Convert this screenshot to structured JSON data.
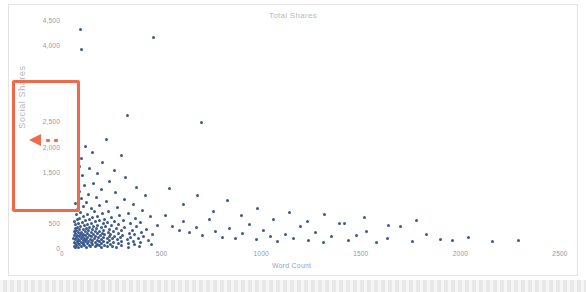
{
  "chart_data": {
    "type": "scatter",
    "title": "Total Shares",
    "xlabel": "Word Count",
    "ylabel": "Social Shares",
    "xlim": [
      0,
      2500
    ],
    "ylim": [
      0,
      4500
    ],
    "grid": false,
    "legend": null,
    "marker_color": "#3a5a8c",
    "xticks": [
      "0",
      "500",
      "1000",
      "1500",
      "2000",
      "2500"
    ],
    "xtick_values": [
      0,
      500,
      1000,
      1500,
      2000,
      2500
    ],
    "yticks": [
      "0",
      "500",
      "1,500",
      "2,000",
      "2,500",
      "4,000",
      "4,500"
    ],
    "ytick_values": [
      0,
      500,
      1500,
      2000,
      2500,
      4000,
      4500
    ],
    "points": [
      [
        92,
        4320
      ],
      [
        96,
        3910
      ],
      [
        460,
        4150
      ],
      [
        330,
        2620
      ],
      [
        700,
        2470
      ],
      [
        225,
        2150
      ],
      [
        118,
        2010
      ],
      [
        152,
        1880
      ],
      [
        300,
        1820
      ],
      [
        98,
        1760
      ],
      [
        205,
        1690
      ],
      [
        88,
        1600
      ],
      [
        140,
        1560
      ],
      [
        262,
        1520
      ],
      [
        178,
        1470
      ],
      [
        104,
        1430
      ],
      [
        318,
        1390
      ],
      [
        82,
        1350
      ],
      [
        238,
        1310
      ],
      [
        158,
        1270
      ],
      [
        112,
        1230
      ],
      [
        372,
        1190
      ],
      [
        196,
        1160
      ],
      [
        86,
        1120
      ],
      [
        268,
        1090
      ],
      [
        132,
        1060
      ],
      [
        420,
        1030
      ],
      [
        172,
        1000
      ],
      [
        96,
        975
      ],
      [
        312,
        950
      ],
      [
        222,
        925
      ],
      [
        124,
        900
      ],
      [
        66,
        880
      ],
      [
        358,
        860
      ],
      [
        186,
        840
      ],
      [
        108,
        820
      ],
      [
        280,
        800
      ],
      [
        148,
        780
      ],
      [
        78,
        760
      ],
      [
        402,
        745
      ],
      [
        232,
        730
      ],
      [
        162,
        715
      ],
      [
        94,
        700
      ],
      [
        334,
        688
      ],
      [
        202,
        676
      ],
      [
        126,
        664
      ],
      [
        72,
        652
      ],
      [
        290,
        640
      ],
      [
        176,
        630
      ],
      [
        110,
        620
      ],
      [
        446,
        612
      ],
      [
        246,
        604
      ],
      [
        154,
        596
      ],
      [
        88,
        588
      ],
      [
        368,
        580
      ],
      [
        214,
        572
      ],
      [
        138,
        565
      ],
      [
        80,
        558
      ],
      [
        308,
        550
      ],
      [
        190,
        543
      ],
      [
        118,
        536
      ],
      [
        62,
        530
      ],
      [
        262,
        523
      ],
      [
        168,
        516
      ],
      [
        102,
        510
      ],
      [
        392,
        504
      ],
      [
        228,
        498
      ],
      [
        146,
        492
      ],
      [
        84,
        486
      ],
      [
        344,
        480
      ],
      [
        206,
        474
      ],
      [
        128,
        468
      ],
      [
        70,
        462
      ],
      [
        284,
        456
      ],
      [
        180,
        450
      ],
      [
        112,
        445
      ],
      [
        478,
        440
      ],
      [
        250,
        435
      ],
      [
        160,
        430
      ],
      [
        94,
        425
      ],
      [
        372,
        420
      ],
      [
        218,
        415
      ],
      [
        140,
        410
      ],
      [
        76,
        405
      ],
      [
        316,
        400
      ],
      [
        196,
        395
      ],
      [
        122,
        390
      ],
      [
        66,
        386
      ],
      [
        272,
        382
      ],
      [
        174,
        378
      ],
      [
        106,
        374
      ],
      [
        424,
        370
      ],
      [
        240,
        366
      ],
      [
        154,
        362
      ],
      [
        88,
        358
      ],
      [
        356,
        354
      ],
      [
        210,
        350
      ],
      [
        134,
        346
      ],
      [
        74,
        342
      ],
      [
        298,
        338
      ],
      [
        186,
        334
      ],
      [
        116,
        330
      ],
      [
        62,
        326
      ],
      [
        258,
        322
      ],
      [
        166,
        318
      ],
      [
        100,
        314
      ],
      [
        398,
        310
      ],
      [
        232,
        306
      ],
      [
        148,
        302
      ],
      [
        84,
        298
      ],
      [
        338,
        294
      ],
      [
        202,
        290
      ],
      [
        128,
        287
      ],
      [
        70,
        284
      ],
      [
        286,
        281
      ],
      [
        178,
        278
      ],
      [
        110,
        275
      ],
      [
        452,
        272
      ],
      [
        244,
        269
      ],
      [
        158,
        266
      ],
      [
        92,
        263
      ],
      [
        364,
        260
      ],
      [
        214,
        257
      ],
      [
        138,
        254
      ],
      [
        78,
        251
      ],
      [
        306,
        248
      ],
      [
        192,
        245
      ],
      [
        120,
        242
      ],
      [
        64,
        239
      ],
      [
        266,
        236
      ],
      [
        170,
        233
      ],
      [
        102,
        230
      ],
      [
        408,
        227
      ],
      [
        236,
        224
      ],
      [
        150,
        221
      ],
      [
        86,
        218
      ],
      [
        346,
        215
      ],
      [
        206,
        212
      ],
      [
        130,
        209
      ],
      [
        72,
        206
      ],
      [
        292,
        203
      ],
      [
        182,
        200
      ],
      [
        112,
        197
      ],
      [
        60,
        194
      ],
      [
        254,
        191
      ],
      [
        164,
        188
      ],
      [
        98,
        185
      ],
      [
        384,
        182
      ],
      [
        226,
        179
      ],
      [
        144,
        176
      ],
      [
        82,
        173
      ],
      [
        330,
        170
      ],
      [
        198,
        167
      ],
      [
        124,
        164
      ],
      [
        68,
        161
      ],
      [
        278,
        158
      ],
      [
        176,
        155
      ],
      [
        108,
        152
      ],
      [
        436,
        150
      ],
      [
        240,
        147
      ],
      [
        152,
        144
      ],
      [
        90,
        141
      ],
      [
        358,
        138
      ],
      [
        210,
        135
      ],
      [
        134,
        132
      ],
      [
        76,
        129
      ],
      [
        300,
        126
      ],
      [
        188,
        123
      ],
      [
        116,
        120
      ],
      [
        62,
        117
      ],
      [
        260,
        114
      ],
      [
        168,
        111
      ],
      [
        100,
        108
      ],
      [
        392,
        105
      ],
      [
        230,
        102
      ],
      [
        146,
        99
      ],
      [
        84,
        96
      ],
      [
        336,
        93
      ],
      [
        200,
        90
      ],
      [
        126,
        87
      ],
      [
        70,
        84
      ],
      [
        284,
        81
      ],
      [
        178,
        78
      ],
      [
        110,
        75
      ],
      [
        448,
        72
      ],
      [
        242,
        69
      ],
      [
        154,
        66
      ],
      [
        90,
        63
      ],
      [
        362,
        60
      ],
      [
        212,
        57
      ],
      [
        136,
        54
      ],
      [
        74,
        51
      ],
      [
        298,
        48
      ],
      [
        186,
        45
      ],
      [
        114,
        42
      ],
      [
        64,
        39
      ],
      [
        256,
        36
      ],
      [
        166,
        33
      ],
      [
        98,
        30
      ],
      [
        388,
        28
      ],
      [
        228,
        25
      ],
      [
        144,
        22
      ],
      [
        82,
        19
      ],
      [
        332,
        16
      ],
      [
        196,
        13
      ],
      [
        122,
        10
      ],
      [
        66,
        8
      ],
      [
        274,
        6
      ],
      [
        172,
        50
      ],
      [
        106,
        95
      ],
      [
        520,
        640
      ],
      [
        556,
        430
      ],
      [
        588,
        350
      ],
      [
        612,
        520
      ],
      [
        640,
        300
      ],
      [
        676,
        410
      ],
      [
        704,
        250
      ],
      [
        742,
        560
      ],
      [
        770,
        330
      ],
      [
        806,
        210
      ],
      [
        840,
        380
      ],
      [
        872,
        180
      ],
      [
        906,
        290
      ],
      [
        940,
        460
      ],
      [
        978,
        160
      ],
      [
        1012,
        340
      ],
      [
        1048,
        230
      ],
      [
        1084,
        130
      ],
      [
        1122,
        260
      ],
      [
        1160,
        190
      ],
      [
        1198,
        420
      ],
      [
        1236,
        150
      ],
      [
        1274,
        300
      ],
      [
        1312,
        110
      ],
      [
        1352,
        220
      ],
      [
        1392,
        480
      ],
      [
        1436,
        140
      ],
      [
        1480,
        250
      ],
      [
        1528,
        330
      ],
      [
        1578,
        100
      ],
      [
        1636,
        190
      ],
      [
        1700,
        420
      ],
      [
        1760,
        120
      ],
      [
        1830,
        260
      ],
      [
        1900,
        170
      ],
      [
        1960,
        150
      ],
      [
        2040,
        200
      ],
      [
        2160,
        130
      ],
      [
        2290,
        140
      ],
      [
        540,
        1180
      ],
      [
        610,
        860
      ],
      [
        680,
        1040
      ],
      [
        760,
        720
      ],
      [
        830,
        940
      ],
      [
        900,
        640
      ],
      [
        980,
        780
      ],
      [
        1060,
        560
      ],
      [
        1140,
        700
      ],
      [
        1230,
        520
      ],
      [
        1320,
        660
      ],
      [
        1420,
        480
      ],
      [
        1520,
        600
      ],
      [
        1640,
        440
      ],
      [
        1780,
        540
      ]
    ]
  }
}
